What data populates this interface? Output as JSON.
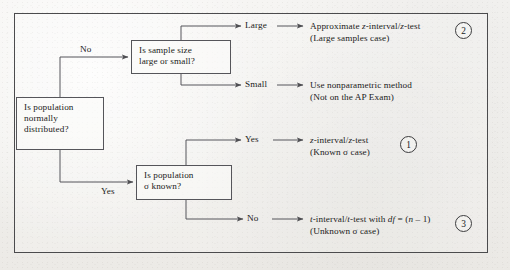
{
  "diagram": {
    "frame_color": "#4b4b4d",
    "box_border_color": "#55555a",
    "line_color": "#55555a",
    "background_color": "#f1f0ed"
  },
  "boxes": {
    "population": {
      "name": "is-population-normally-distributed",
      "lines": [
        "Is population",
        "normally",
        "distributed?"
      ]
    },
    "sample_size": {
      "name": "is-sample-size-large-or-small",
      "lines": [
        "Is sample size",
        "large or small?"
      ]
    },
    "sigma_known": {
      "name": "is-population-sigma-known",
      "lines": [
        "Is population",
        "σ known?"
      ]
    }
  },
  "branch_labels": {
    "no_upper": "No",
    "yes_lower": "Yes",
    "large": "Large",
    "small": "Small",
    "yes_sigma": "Yes",
    "no_sigma": "No"
  },
  "outcomes": {
    "large": {
      "line1_pre": "Approximate ",
      "line1_var": "z",
      "line1_mid": "-interval/",
      "line1_var2": "z",
      "line1_post": "-test",
      "line2": "(Large samples case)",
      "marker": "2"
    },
    "small": {
      "line1": "Use nonparametric method",
      "line2": "(Not on the AP Exam)"
    },
    "z_interval": {
      "line1_var": "z",
      "line1_mid": "-interval/",
      "line1_var2": "z",
      "line1_post": "-test",
      "line2": "(Known σ case)",
      "marker": "1"
    },
    "t_interval": {
      "line1_var": "t",
      "line1_mid": "-interval/",
      "line1_var2": "t",
      "line1_post": "-test with ",
      "line1_df": "df",
      "line1_eq": " = (",
      "line1_n": "n",
      "line1_end": " – 1)",
      "line2": "(Unknown σ case)",
      "marker": "3"
    }
  },
  "markers": {
    "one": "1",
    "two": "2",
    "three": "3"
  }
}
